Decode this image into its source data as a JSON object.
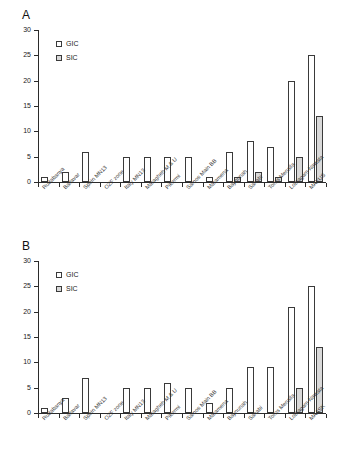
{
  "figure": {
    "panels": [
      {
        "label": "A"
      },
      {
        "label": "B"
      }
    ]
  },
  "legend": {
    "entries": [
      {
        "key": "gic",
        "label": "GIC"
      },
      {
        "key": "sic",
        "label": "SIC"
      }
    ]
  },
  "axis": {
    "y_ticks": [
      "0",
      "5",
      "10",
      "15",
      "20",
      "25",
      "30"
    ],
    "y_min": 0,
    "y_max": 30
  },
  "chart_data": [
    {
      "type": "bar",
      "title": "A",
      "xlabel": "",
      "ylabel": "",
      "ylim": [
        0,
        30
      ],
      "yticks": [
        0,
        5,
        10,
        15,
        20,
        25,
        30
      ],
      "grid": false,
      "legend_position": "top-left",
      "categories": [
        "Rudabanya",
        "Baltavar",
        "Spain MN13",
        "OZF zone",
        "Italy MN13",
        "Maragheh M & U",
        "Pikermi",
        "Samos Main BB",
        "Maramena",
        "Baynunah",
        "Sahabi",
        "Toros Menalla",
        "Lothagam Nawata",
        "MAKUS"
      ],
      "series": [
        {
          "name": "GIC",
          "values": [
            1,
            2,
            6,
            0,
            5,
            5,
            5,
            5,
            1,
            6,
            8,
            7,
            20,
            25
          ]
        },
        {
          "name": "SIC",
          "values": [
            0,
            0,
            0,
            0,
            0,
            0,
            0,
            0,
            0,
            1,
            2,
            1,
            5,
            13
          ]
        }
      ]
    },
    {
      "type": "bar",
      "title": "B",
      "xlabel": "",
      "ylabel": "",
      "ylim": [
        0,
        30
      ],
      "yticks": [
        0,
        5,
        10,
        15,
        20,
        25,
        30
      ],
      "grid": false,
      "legend_position": "top-left",
      "categories": [
        "Rudabanya",
        "Baltavar",
        "Spain MN13",
        "OZF zone",
        "Italy MN13",
        "Maragheh M & U",
        "Pikermi",
        "Samos Main BB",
        "Maramena",
        "Baynunah",
        "Sahabi",
        "Toros Menalla",
        "Lothagam Nawata",
        "MAASK"
      ],
      "series": [
        {
          "name": "GIC",
          "values": [
            1,
            3,
            7,
            0,
            5,
            5,
            6,
            5,
            2,
            5,
            9,
            9,
            21,
            25
          ]
        },
        {
          "name": "SIC",
          "values": [
            0,
            0,
            0,
            0,
            0,
            0,
            0,
            0,
            0,
            0,
            0,
            0,
            5,
            13
          ]
        }
      ]
    }
  ],
  "colors": {
    "gic_fill": "#ffffff",
    "sic_fill": "#d9d9d9",
    "stroke": "#3a3a3a",
    "axis": "#2b2b2b",
    "background": "#ffffff"
  }
}
